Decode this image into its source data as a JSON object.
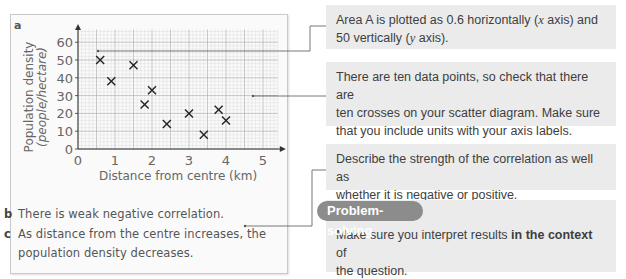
{
  "chart_data": {
    "type": "scatter",
    "part_label": "a",
    "xlabel": "Distance from centre (km)",
    "ylabel_line1": "Population density",
    "ylabel_line2": "(people/hectare)",
    "x_ticks": [
      "0",
      "1",
      "2",
      "3",
      "4",
      "5"
    ],
    "y_ticks": [
      "0",
      "10",
      "20",
      "30",
      "40",
      "50",
      "60"
    ],
    "xlim": [
      0,
      5.4
    ],
    "ylim": [
      0,
      65
    ],
    "grid": true,
    "points": [
      {
        "x": 0.6,
        "y": 50
      },
      {
        "x": 0.9,
        "y": 38
      },
      {
        "x": 1.5,
        "y": 47
      },
      {
        "x": 1.8,
        "y": 25
      },
      {
        "x": 2.0,
        "y": 33
      },
      {
        "x": 2.4,
        "y": 14
      },
      {
        "x": 3.0,
        "y": 20
      },
      {
        "x": 3.4,
        "y": 8
      },
      {
        "x": 3.8,
        "y": 22
      },
      {
        "x": 4.0,
        "y": 16
      }
    ],
    "marker": "x"
  },
  "answers": {
    "b_label": "b",
    "b_text": "There is weak negative correlation.",
    "c_label": "c",
    "c_line1": "As distance from the centre increases, the",
    "c_line2": "population density decreases."
  },
  "notes": {
    "note1": "Area A is plotted as 0.6 horizontally (x axis) and 50 vertically (y axis).",
    "note1_l1a": "Area A is plotted as 0.6 horizontally (",
    "note1_x": "x",
    "note1_l1b": " axis) and",
    "note1_l2a": "50 vertically (",
    "note1_y": "y",
    "note1_l2b": " axis).",
    "note2_l1": "There are ten data points, so check that there are",
    "note2_l2": "ten crosses on your scatter diagram. Make sure",
    "note2_l3": "that you include units with your axis labels.",
    "note3_l1": "Describe the strength of the correlation as well as",
    "note3_l2": "whether it is negative or positive.",
    "ps_badge": "Problem-solving",
    "ps_l1a": "Make sure you interpret results ",
    "ps_l1b": "in the context",
    "ps_l1c": " of",
    "ps_l2": "the question."
  },
  "colors": {
    "grid": "#c8c8c8",
    "note_bg": "#ebebeb",
    "badge_bg": "#8c8c8c"
  }
}
